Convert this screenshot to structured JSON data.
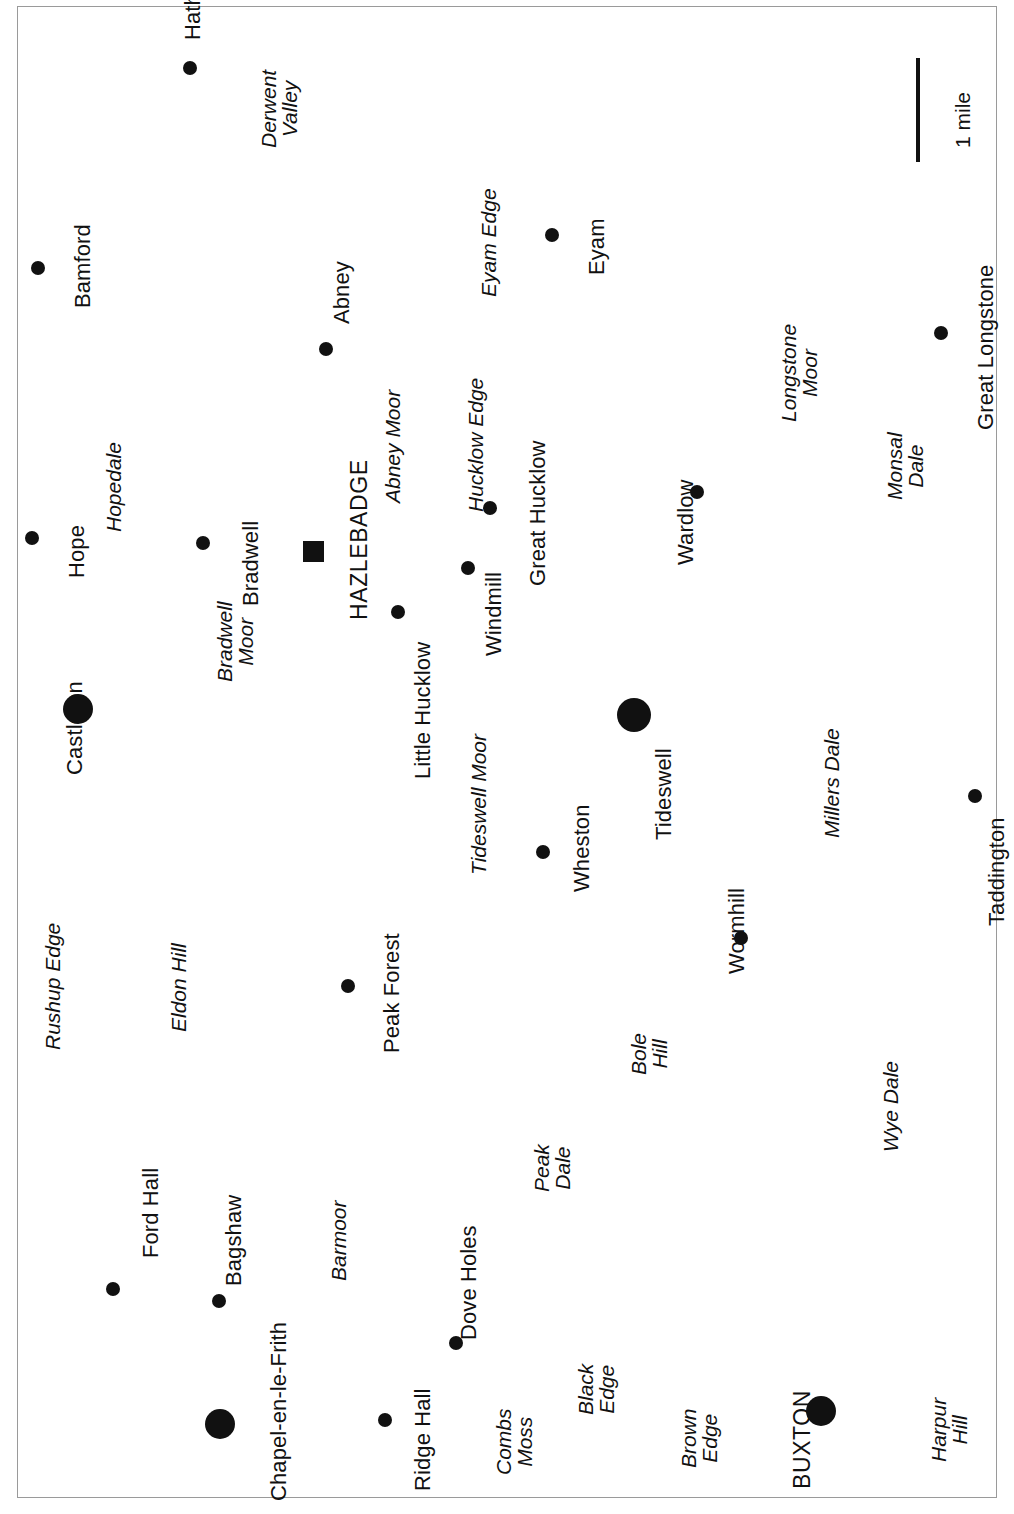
{
  "map": {
    "title": "Peak District area location map",
    "orientation": "rotated-90-ccw",
    "colors": {
      "land_fill": "#e2e2e2",
      "land_stroke": "#9d9d9d",
      "valley_fill": "#ffffff",
      "symbol": "#111111",
      "frame": "#9a9a9a"
    },
    "scale": {
      "label": "1 mile"
    },
    "settlements": [
      {
        "name": "Hathersage",
        "symbol": "circle-small",
        "x": 190,
        "y": 68
      },
      {
        "name": "Bamford",
        "symbol": "circle-small",
        "x": 38,
        "y": 268
      },
      {
        "name": "Eyam",
        "symbol": "circle-small",
        "x": 552,
        "y": 235
      },
      {
        "name": "Great Longstone",
        "symbol": "circle-small",
        "x": 941,
        "y": 333
      },
      {
        "name": "Abney",
        "symbol": "circle-small",
        "x": 326,
        "y": 349
      },
      {
        "name": "Great Hucklow",
        "symbol": "circle-small",
        "x": 490,
        "y": 508
      },
      {
        "name": "Wardlow",
        "symbol": "circle-small",
        "x": 697,
        "y": 492
      },
      {
        "name": "Hope",
        "symbol": "circle-small",
        "x": 32,
        "y": 538
      },
      {
        "name": "Bradwell",
        "symbol": "circle-small",
        "x": 203,
        "y": 543
      },
      {
        "name": "HAZLEBADGE",
        "symbol": "square",
        "x": 313,
        "y": 551
      },
      {
        "name": "Windmill",
        "symbol": "circle-small",
        "x": 468,
        "y": 568
      },
      {
        "name": "Little Hucklow",
        "symbol": "circle-small",
        "x": 398,
        "y": 612
      },
      {
        "name": "Castleton",
        "symbol": "circle-large",
        "x": 78,
        "y": 709
      },
      {
        "name": "Tideswell",
        "symbol": "circle-large",
        "x": 634,
        "y": 715
      },
      {
        "name": "Taddington",
        "symbol": "circle-small",
        "x": 975,
        "y": 796
      },
      {
        "name": "Wheston",
        "symbol": "circle-small",
        "x": 543,
        "y": 852
      },
      {
        "name": "Wormhill",
        "symbol": "circle-small",
        "x": 741,
        "y": 938
      },
      {
        "name": "Peak Forest",
        "symbol": "circle-small",
        "x": 348,
        "y": 986
      },
      {
        "name": "Ford Hall",
        "symbol": "circle-small",
        "x": 113,
        "y": 1289
      },
      {
        "name": "Bagshaw",
        "symbol": "circle-small",
        "x": 219,
        "y": 1301
      },
      {
        "name": "Dove Holes",
        "symbol": "circle-small",
        "x": 456,
        "y": 1343
      },
      {
        "name": "Chapel-en-le-Frith",
        "symbol": "circle-large",
        "x": 220,
        "y": 1424
      },
      {
        "name": "Ridge Hall",
        "symbol": "circle-small",
        "x": 385,
        "y": 1420
      },
      {
        "name": "BUXTON",
        "symbol": "circle-large",
        "x": 821,
        "y": 1411
      }
    ],
    "areas": [
      {
        "name": "Derwent Valley",
        "lines": [
          "Derwent",
          "Valley"
        ]
      },
      {
        "name": "Eyam Edge",
        "lines": [
          "Eyam Edge"
        ]
      },
      {
        "name": "Abney Moor",
        "lines": [
          "Abney Moor"
        ]
      },
      {
        "name": "Hucklow Edge",
        "lines": [
          "Hucklow Edge"
        ]
      },
      {
        "name": "Longstone Moor",
        "lines": [
          "Longstone",
          "Moor"
        ]
      },
      {
        "name": "Monsal Dale",
        "lines": [
          "Monsal",
          "Dale"
        ]
      },
      {
        "name": "Hopedale",
        "lines": [
          "Hopedale"
        ]
      },
      {
        "name": "Bradwell Moor",
        "lines": [
          "Bradwell",
          "Moor"
        ]
      },
      {
        "name": "Tideswell Moor",
        "lines": [
          "Tideswell Moor"
        ]
      },
      {
        "name": "Millers Dale",
        "lines": [
          "Millers Dale"
        ]
      },
      {
        "name": "Rushup Edge",
        "lines": [
          "Rushup Edge"
        ]
      },
      {
        "name": "Eldon Hill",
        "lines": [
          "Eldon Hill"
        ]
      },
      {
        "name": "Barmoor",
        "lines": [
          "Barmoor"
        ]
      },
      {
        "name": "Peak Dale",
        "lines": [
          "Peak",
          "Dale"
        ]
      },
      {
        "name": "Bole Hill",
        "lines": [
          "Bole",
          "Hill"
        ]
      },
      {
        "name": "Wye Dale",
        "lines": [
          "Wye Dale"
        ]
      },
      {
        "name": "Combs Moss",
        "lines": [
          "Combs",
          "Moss"
        ]
      },
      {
        "name": "Black Edge",
        "lines": [
          "Black",
          "Edge"
        ]
      },
      {
        "name": "Brown Edge",
        "lines": [
          "Brown",
          "Edge"
        ]
      },
      {
        "name": "Harpur Hill",
        "lines": [
          "Harpur",
          "Hill"
        ]
      }
    ]
  }
}
